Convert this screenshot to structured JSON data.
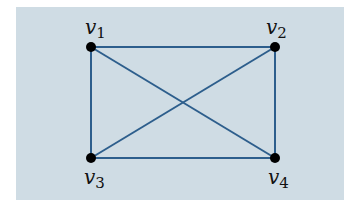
{
  "diagram": {
    "type": "graph",
    "background_color": "#cfdce4",
    "edge_color": "#2d5e8c",
    "node_color": "#000000",
    "nodes": [
      {
        "id": "v1",
        "label": "v",
        "sub": "1",
        "x": 91,
        "y": 47
      },
      {
        "id": "v2",
        "label": "v",
        "sub": "2",
        "x": 275,
        "y": 47
      },
      {
        "id": "v3",
        "label": "v",
        "sub": "3",
        "x": 91,
        "y": 158
      },
      {
        "id": "v4",
        "label": "v",
        "sub": "4",
        "x": 275,
        "y": 158
      }
    ],
    "edges": [
      [
        "v1",
        "v2"
      ],
      [
        "v1",
        "v3"
      ],
      [
        "v2",
        "v4"
      ],
      [
        "v3",
        "v4"
      ],
      [
        "v1",
        "v4"
      ],
      [
        "v2",
        "v3"
      ]
    ]
  }
}
